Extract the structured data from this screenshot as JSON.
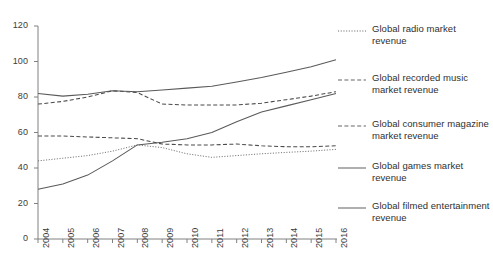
{
  "chart_data": {
    "type": "line",
    "title": "",
    "subtitle": "",
    "xlabel": "",
    "ylabel": "",
    "x": [
      2004,
      2005,
      2006,
      2007,
      2008,
      2009,
      2010,
      2011,
      2012,
      2013,
      2014,
      2015,
      2016
    ],
    "categories": [
      "2004",
      "2005",
      "2006",
      "2007",
      "2008",
      "2009",
      "2010",
      "2011",
      "2012",
      "2013",
      "2014",
      "2015",
      "2016"
    ],
    "xlim": [
      2004,
      2016
    ],
    "ylim": [
      0,
      120
    ],
    "yticks": [
      0,
      20,
      40,
      60,
      80,
      100,
      120
    ],
    "ytick_labels": [
      "0",
      "20",
      "40",
      "60",
      "80",
      "100",
      "120"
    ],
    "xtick_labels": [
      "2004",
      "2005",
      "2006",
      "2007",
      "2008",
      "2009",
      "2010",
      "2011",
      "2012",
      "2013",
      "2014",
      "2015",
      "2016"
    ],
    "grid": false,
    "legend_position": "right",
    "series": [
      {
        "name": "Global radio market revenue",
        "style": "dotted",
        "color": "#6b6b6b",
        "values": [
          44,
          45.5,
          47,
          49.5,
          53,
          51.5,
          48,
          46,
          47,
          48,
          48.8,
          49.5,
          50.5
        ]
      },
      {
        "name": "Global recorded music market revenue",
        "style": "dashed",
        "color": "#4a4a4a",
        "values": [
          76,
          77.5,
          80,
          83.5,
          82.5,
          76,
          75.5,
          75.5,
          75.5,
          76.5,
          78.5,
          80.5,
          83
        ]
      },
      {
        "name": "Global consumer magazine market revenue",
        "style": "dashed",
        "color": "#4a4a4a",
        "values": [
          58,
          58,
          57.5,
          57,
          56.5,
          53.5,
          53,
          53,
          53.5,
          52.5,
          52,
          52,
          52.5
        ]
      },
      {
        "name": "Global games market revenue",
        "style": "solid",
        "color": "#5a5a5a",
        "values": [
          28,
          31,
          36,
          44,
          53,
          54.5,
          56.5,
          60,
          66,
          71.5,
          75,
          78.5,
          82
        ]
      },
      {
        "name": "Global filmed entertainment revenue",
        "style": "solid",
        "color": "#5a5a5a",
        "values": [
          82,
          80.5,
          81.5,
          83.5,
          83,
          84,
          85,
          86,
          88.5,
          91,
          94,
          97,
          101
        ]
      }
    ]
  },
  "legend": {
    "items": [
      {
        "label": "Global radio market revenue",
        "style": "dotted"
      },
      {
        "label": "Global recorded music market revenue",
        "style": "dashed"
      },
      {
        "label": "Global consumer magazine market revenue",
        "style": "dashed"
      },
      {
        "label": "Global games market revenue",
        "style": "solid"
      },
      {
        "label": "Global filmed entertainment revenue",
        "style": "solid"
      }
    ]
  },
  "axis": {
    "y_ticks": [
      "120",
      "100",
      "80",
      "60",
      "40",
      "20",
      "0"
    ],
    "x_ticks": [
      "2004",
      "2005",
      "2006",
      "2007",
      "2008",
      "2009",
      "2010",
      "2011",
      "2012",
      "2013",
      "2014",
      "2015",
      "2016"
    ]
  }
}
